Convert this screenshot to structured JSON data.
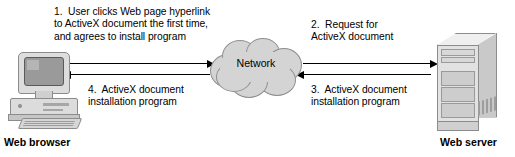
{
  "diagram": {
    "colors": {
      "line": "#000000",
      "cloud_fill": "#d4d4d4",
      "cloud_stroke": "#8e8e8e",
      "device_fill": "#dddddd",
      "background": "#ffffff"
    },
    "nodes": {
      "browser": {
        "label": "Web browser",
        "icon": "desktop-computer-icon"
      },
      "network": {
        "label": "Network",
        "icon": "cloud-icon"
      },
      "server": {
        "label": "Web server",
        "icon": "tower-server-icon"
      }
    },
    "steps": [
      {
        "number": "1.",
        "text": "1.  User clicks Web page hyperlink\nto ActiveX document the first time,\nand agrees to install program",
        "direction": "browser-to-network",
        "arrow": "right"
      },
      {
        "number": "2.",
        "text": "2.  Request for\nActiveX document",
        "direction": "network-to-server",
        "arrow": "right"
      },
      {
        "number": "3.",
        "text": "3.  ActiveX document\ninstallation program",
        "direction": "server-to-network",
        "arrow": "left"
      },
      {
        "number": "4.",
        "text": "4.  ActiveX document\ninstallation program",
        "direction": "network-to-browser",
        "arrow": "left"
      }
    ]
  }
}
